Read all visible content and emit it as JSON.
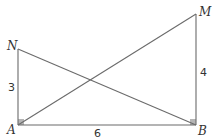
{
  "diagram": {
    "type": "geometry",
    "points": {
      "A": {
        "label": "A"
      },
      "B": {
        "label": "B"
      },
      "M": {
        "label": "M"
      },
      "N": {
        "label": "N"
      }
    },
    "segments": [
      {
        "from": "A",
        "to": "B",
        "length_label": "6"
      },
      {
        "from": "A",
        "to": "N",
        "length_label": "3"
      },
      {
        "from": "B",
        "to": "M",
        "length_label": "4"
      },
      {
        "from": "A",
        "to": "M",
        "length_label": ""
      },
      {
        "from": "N",
        "to": "B",
        "length_label": ""
      }
    ],
    "right_angles": [
      "A",
      "B"
    ],
    "colors": {
      "line": "#6b6b6b",
      "right_angle_marker": "#b5b5b5",
      "text": "#333333"
    }
  }
}
